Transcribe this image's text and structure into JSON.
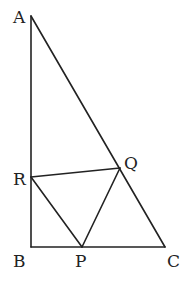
{
  "diagram": {
    "type": "geometry",
    "stroke_color": "#222222",
    "points": {
      "A": {
        "label": "A",
        "x": 31,
        "y": 16
      },
      "B": {
        "label": "B",
        "x": 31,
        "y": 247
      },
      "C": {
        "label": "C",
        "x": 165,
        "y": 247
      },
      "R": {
        "label": "R",
        "x": 31,
        "y": 177
      },
      "Q": {
        "label": "Q",
        "x": 120,
        "y": 168
      },
      "P": {
        "label": "P",
        "x": 82,
        "y": 247
      }
    },
    "segments": [
      [
        "A",
        "B"
      ],
      [
        "B",
        "C"
      ],
      [
        "A",
        "C"
      ],
      [
        "R",
        "Q"
      ],
      [
        "R",
        "P"
      ],
      [
        "P",
        "Q"
      ]
    ]
  }
}
